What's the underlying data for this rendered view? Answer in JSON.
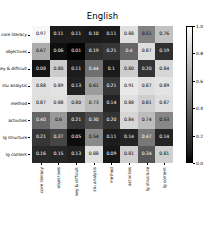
{
  "figure": {
    "title": "English",
    "background": "#ffffff",
    "text_color": "#000000"
  },
  "colorbar": {
    "vmin": 0.0,
    "vmax": 1.0,
    "ticks": [
      "1.0",
      "0.8",
      "0.6",
      "0.4",
      "0.2",
      "0.0"
    ],
    "tick_values": [
      1.0,
      0.8,
      0.6,
      0.4,
      0.2,
      0.0
    ],
    "low_color": "#000000",
    "high_color": "#ffffff",
    "orientation": "vertical"
  },
  "chart_data": {
    "type": "heatmap",
    "title": "English",
    "xlabel": "",
    "ylabel": "",
    "grid": false,
    "legend_position": "right",
    "cmap": "gray",
    "vmin": 0.0,
    "vmax": 1.0,
    "annotated": true,
    "row_labels": [
      "core literacy",
      "objectives",
      "key & difficult",
      "stu analysis",
      "method",
      "activities",
      "lg structure",
      "lg content"
    ],
    "col_labels": [
      "core literacy",
      "objectives",
      "key & difficult",
      "stu analysis",
      "method",
      "activities",
      "lg structure",
      "lg content"
    ],
    "values": [
      [
        0.97,
        0.11,
        0.11,
        0.1,
        0.11,
        0.88,
        0.51,
        0.76
      ],
      [
        0.67,
        0.06,
        0.01,
        0.19,
        0.21,
        0.4,
        0.87,
        0.19
      ],
      [
        0.08,
        0.8,
        0.11,
        0.44,
        0.1,
        0.8,
        0.2,
        0.84
      ],
      [
        0.88,
        0.89,
        0.13,
        0.61,
        0.21,
        0.91,
        0.87,
        0.89
      ],
      [
        0.87,
        0.88,
        0.8,
        0.73,
        0.14,
        0.88,
        0.81,
        0.87
      ],
      [
        0.4,
        0.6,
        0.21,
        0.3,
        0.2,
        0.84,
        0.74,
        0.53
      ],
      [
        0.21,
        0.27,
        0.05,
        0.54,
        0.11,
        0.14,
        0.47,
        0.14
      ],
      [
        0.16,
        0.15,
        0.13,
        0.88,
        0.09,
        0.81,
        0.34,
        0.81
      ]
    ],
    "value_labels": [
      [
        "0.97",
        "0.11",
        "0.11",
        "0.10",
        "0.11",
        "0.88",
        "0.51",
        "0.76"
      ],
      [
        "0.67",
        "0.06",
        "0.01",
        "0.19",
        "0.21",
        "0.4",
        "0.87",
        "0.19"
      ],
      [
        "0.08",
        "0.80",
        "0.11",
        "0.44",
        "0.1",
        "0.80",
        "0.20",
        "0.84"
      ],
      [
        "0.88",
        "0.89",
        "0.13",
        "0.61",
        "0.21",
        "0.91",
        "0.87",
        "0.89"
      ],
      [
        "0.87",
        "0.88",
        "0.80",
        "0.73",
        "0.14",
        "0.88",
        "0.81",
        "0.87"
      ],
      [
        "0.40",
        "0.6",
        "0.21",
        "0.30",
        "0.20",
        "0.84",
        "0.74",
        "0.53"
      ],
      [
        "0.21",
        "0.27",
        "0.05",
        "0.54",
        "0.11",
        "0.14",
        "0.47",
        "0.14"
      ],
      [
        "0.16",
        "0.15",
        "0.13",
        "0.88",
        "0.09",
        "0.81",
        "0.34",
        "0.81"
      ]
    ]
  }
}
